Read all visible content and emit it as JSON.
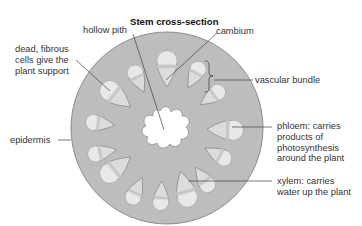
{
  "title": "Stem cross-section",
  "labels": {
    "hollow_pith": "hollow pith",
    "cambium": "cambium",
    "dead_fibrous": [
      "dead, fibrous",
      "cells give the",
      "plant support"
    ],
    "vascular_bundle": "vascular bundle",
    "epidermis": "epidermis",
    "phloem": [
      "phloem: carries",
      "products of",
      "photosynthesis",
      "around the plant"
    ],
    "xylem": [
      "xylem: carries",
      "water up the plant"
    ]
  },
  "colors": {
    "stem_fill": "#bdbdbd",
    "stem_stroke": "#8e8e8e",
    "bundle_fill": "#dcdcdc",
    "bundle_light": "#ececec",
    "pith_fill": "#ffffff",
    "leader_line": "#444444"
  }
}
